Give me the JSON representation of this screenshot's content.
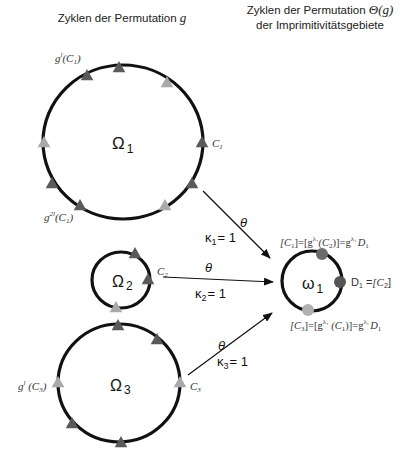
{
  "headers": {
    "left": {
      "text": "Zyklen der Permutation ",
      "var": "g"
    },
    "right_line1": {
      "text": "Zyklen der Permutation ",
      "var": "Θ(g)"
    },
    "right_line2": "der Imprimitivitätsgebiete"
  },
  "colors": {
    "stroke": "#111111",
    "dark_marker": "#5a5a5a",
    "light_marker": "#a9a9a9",
    "dot_top": "#6a6a6a",
    "dot_right": "#555555",
    "dot_bottom": "#b0b0b0"
  },
  "cycles": [
    {
      "id": "omega1",
      "label": "Ω",
      "sub": "1",
      "cx": 123,
      "cy": 142,
      "rx": 80,
      "ry": 77,
      "markers": [
        {
          "x": 119,
          "y": 68,
          "shade": "dark"
        },
        {
          "x": 87,
          "y": 76,
          "shade": "dark"
        },
        {
          "x": 167,
          "y": 83,
          "shade": "light"
        },
        {
          "x": 44,
          "y": 143,
          "shade": "light"
        },
        {
          "x": 202,
          "y": 143,
          "shade": "dark"
        },
        {
          "x": 192,
          "y": 184,
          "shade": "dark"
        },
        {
          "x": 165,
          "y": 206,
          "shade": "light"
        },
        {
          "x": 52,
          "y": 184,
          "shade": "dark"
        },
        {
          "x": 80,
          "y": 206,
          "shade": "dark"
        }
      ],
      "labels": {
        "top": "g",
        "top_sup": "l",
        "top_arg": "(C",
        "top_sub": "1",
        "top_close": ")",
        "right": "C",
        "right_sub": "1",
        "bottom": "g",
        "bottom_sup": "2l",
        "bottom_arg": "(C",
        "bottom_sub": "1",
        "bottom_close": ")"
      }
    },
    {
      "id": "omega2",
      "label": "Ω",
      "sub": "2",
      "cx": 121,
      "cy": 280,
      "rx": 29,
      "ry": 28,
      "markers": [
        {
          "x": 135,
          "y": 254,
          "shade": "dark"
        },
        {
          "x": 148,
          "y": 280,
          "shade": "dark"
        },
        {
          "x": 116,
          "y": 308,
          "shade": "light"
        }
      ],
      "labels": {
        "right": "C",
        "right_sub": "2"
      }
    },
    {
      "id": "omega3",
      "label": "Ω",
      "sub": "3",
      "cx": 119,
      "cy": 383,
      "rx": 61,
      "ry": 59,
      "markers": [
        {
          "x": 118,
          "y": 326,
          "shade": "dark"
        },
        {
          "x": 157,
          "y": 340,
          "shade": "dark"
        },
        {
          "x": 180,
          "y": 383,
          "shade": "light"
        },
        {
          "x": 58,
          "y": 383,
          "shade": "light"
        },
        {
          "x": 72,
          "y": 424,
          "shade": "dark"
        },
        {
          "x": 121,
          "y": 443,
          "shade": "dark"
        }
      ],
      "labels": {
        "left": "g",
        "left_sup": "l",
        "left_arg": " (C",
        "left_sub": "3",
        "left_close": ")",
        "right": "C",
        "right_sub": "3"
      }
    }
  ],
  "target": {
    "label": "ω",
    "sub": "1",
    "cx": 312,
    "cy": 281,
    "r": 30,
    "top_label": "[C₁]=[g^λ₁(C₂)]=g^λ₁ D₁",
    "top_parts": {
      "a": "[C",
      "a_sub": "1",
      "b": "]=[g",
      "b_sup": "λ₁",
      "c": "(C",
      "c_sub": "2",
      "d": ")]=g",
      "d_sup": "λ₁",
      "e": "D",
      "e_sub": "1"
    },
    "right_parts": {
      "a": "D",
      "a_sub": "1",
      "b": " =",
      "c": "[C",
      "c_sub": "2",
      "d": "]"
    },
    "bottom_parts": {
      "a": "[C",
      "a_sub": "3",
      "b": "]=[g",
      "b_sup": "λ₁",
      "c": " (C",
      "c_sub": "1",
      "d": ")]=g",
      "d_sup": "λ₁",
      "e": "D",
      "e_sub": "1"
    }
  },
  "arrows": [
    {
      "id": "arrow1",
      "theta": "θ",
      "kappa": "κ",
      "kappa_sub": "1",
      "kappa_val": "= 1"
    },
    {
      "id": "arrow2",
      "theta": "θ",
      "kappa": "κ",
      "kappa_sub": "2",
      "kappa_val": "= 1"
    },
    {
      "id": "arrow3",
      "theta": "θ",
      "kappa": "κ",
      "kappa_sub": "3",
      "kappa_val": "= 1"
    }
  ]
}
